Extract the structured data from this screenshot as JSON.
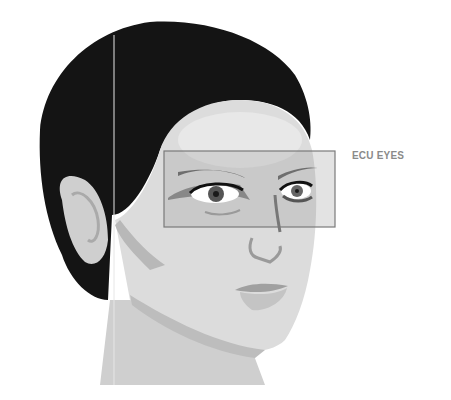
{
  "diagram": {
    "frame_label": "ECU EYES",
    "frame": {
      "x": 164,
      "y": 151,
      "width": 171,
      "height": 76
    },
    "colors": {
      "hair": "#141414",
      "skin_light": "#dcdcdc",
      "skin_mid": "#c8c8c8",
      "skin_shadow": "#a8a8a8",
      "frame_stroke": "#7a7a7a",
      "frame_fill": "#9a9a9a",
      "label": "#8a8a8a"
    }
  }
}
